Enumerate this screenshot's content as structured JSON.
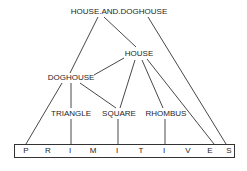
{
  "diagram": {
    "type": "hierarchy",
    "nodes": {
      "house_and_doghouse": "HOUSE.AND.DOGHOUSE",
      "house": "HOUSE",
      "doghouse": "DOGHOUSE",
      "triangle": "TRIANGLE",
      "square": "SQUARE",
      "rhombus": "RHOMBUS"
    },
    "primitives": {
      "label": "PRIMITIVES",
      "letters": [
        "P",
        "R",
        "I",
        "M",
        "I",
        "T",
        "I",
        "V",
        "E",
        "S"
      ]
    },
    "edges": [
      [
        "HOUSE.AND.DOGHOUSE",
        "DOGHOUSE"
      ],
      [
        "HOUSE.AND.DOGHOUSE",
        "HOUSE"
      ],
      [
        "HOUSE.AND.DOGHOUSE",
        "PRIMITIVES"
      ],
      [
        "HOUSE",
        "DOGHOUSE"
      ],
      [
        "HOUSE",
        "SQUARE"
      ],
      [
        "HOUSE",
        "RHOMBUS"
      ],
      [
        "HOUSE",
        "PRIMITIVES"
      ],
      [
        "DOGHOUSE",
        "PRIMITIVES"
      ],
      [
        "DOGHOUSE",
        "TRIANGLE"
      ],
      [
        "DOGHOUSE",
        "SQUARE"
      ],
      [
        "TRIANGLE",
        "PRIMITIVES"
      ],
      [
        "SQUARE",
        "PRIMITIVES"
      ],
      [
        "RHOMBUS",
        "PRIMITIVES"
      ]
    ],
    "colors": {
      "line": "#333333",
      "text": "#1e1e1e",
      "background": "#ffffff"
    }
  }
}
